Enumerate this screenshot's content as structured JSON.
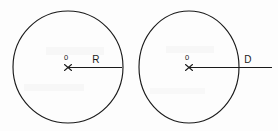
{
  "figure": {
    "background_color": "#fdfdfd",
    "stroke_color": "#1a1a1a",
    "width": 278,
    "height": 131,
    "shapes": [
      {
        "name": "left-circle",
        "center_label": "0",
        "measure_label": "R",
        "measure_meaning": "radius",
        "center_x": 68,
        "center_y": 67,
        "radius": 55,
        "center_label_x": 66,
        "center_label_y": 60,
        "measure_label_x": 93,
        "measure_label_y": 63,
        "line_x1": 68,
        "line_x2": 122,
        "line_y": 67.5
      },
      {
        "name": "right-circle",
        "center_label": "0",
        "measure_label": "D",
        "measure_meaning": "diameter",
        "center_x": 189,
        "center_y": 67,
        "radius": 50,
        "center_label_x": 187,
        "center_label_y": 60,
        "measure_label_x": 245,
        "measure_label_y": 63,
        "line_x1": 189,
        "line_x2": 272,
        "line_y": 67.5
      }
    ]
  }
}
